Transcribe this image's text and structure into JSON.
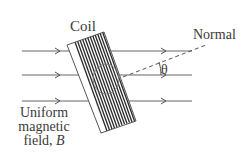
{
  "diagram": {
    "labels": {
      "coil": "Coil",
      "normal": "Normal",
      "theta": "θ",
      "field_line1": "Uniform",
      "field_line2": "magnetic",
      "field_line3_prefix": "field, ",
      "field_symbol": "B"
    },
    "colors": {
      "line": "#555555",
      "coil_stripe": "#2a2a2a",
      "text": "#3a3a3a",
      "background": "#ffffff"
    },
    "field_lines": [
      {
        "y": 51,
        "x_start": 22,
        "x_end": 192
      },
      {
        "y": 75,
        "x_start": 22,
        "x_end": 192
      },
      {
        "y": 101,
        "x_start": 22,
        "x_end": 192
      }
    ],
    "normal_line": {
      "x1": 123,
      "y1": 77,
      "x2": 206,
      "y2": 45,
      "style": "dashed"
    },
    "angle_symbol": "θ"
  }
}
